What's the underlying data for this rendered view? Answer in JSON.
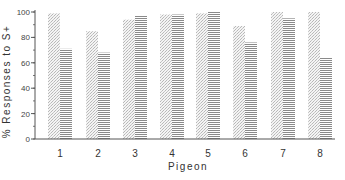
{
  "chart_data": {
    "type": "bar",
    "title": "",
    "xlabel": "Pigeon",
    "ylabel": "% Responses to S+",
    "categories": [
      "1",
      "2",
      "3",
      "4",
      "5",
      "6",
      "7",
      "8"
    ],
    "series": [
      {
        "name": "Series A (stippled)",
        "pattern": "stipple",
        "values": [
          99,
          85,
          94,
          98,
          99,
          89,
          100,
          100
        ]
      },
      {
        "name": "Series B (horizontal stripes)",
        "pattern": "hstripe",
        "values": [
          71,
          68,
          97,
          98,
          100,
          76,
          95,
          64
        ]
      }
    ],
    "ylim": [
      0,
      100
    ],
    "yticks": [
      0,
      20,
      40,
      60,
      80,
      100
    ],
    "yminor_step": 10,
    "grid": false,
    "legend": "none"
  },
  "colors": {
    "axis": "#555555",
    "stipple": "#b8b8b8",
    "stripe": "#8a8a8a"
  }
}
